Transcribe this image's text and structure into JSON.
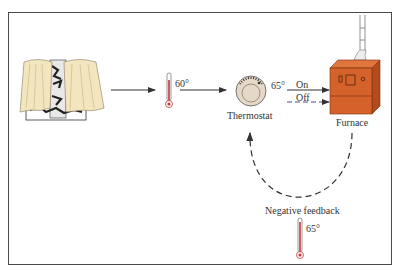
{
  "diagram": {
    "nodes": {
      "window": {
        "label": ""
      },
      "thermometer_room": {
        "reading": "60°"
      },
      "thermostat": {
        "label": "Thermostat",
        "setpoint": "65°"
      },
      "furnace": {
        "label": "Furnace"
      },
      "thermometer_result": {
        "reading": "65°"
      }
    },
    "signals": {
      "on": "On",
      "off": "Off"
    },
    "feedback_label": "Negative feedback",
    "colors": {
      "frame": "#4a4a4a",
      "curtain": "#f3e6bf",
      "furnace": "#d4622a",
      "furnace_dark": "#b24c1c",
      "thermometer_red": "#c0393b",
      "thermostat_dial": "#e6d8c8",
      "off_line": "#4a4aa0",
      "arrow": "#333333"
    }
  }
}
